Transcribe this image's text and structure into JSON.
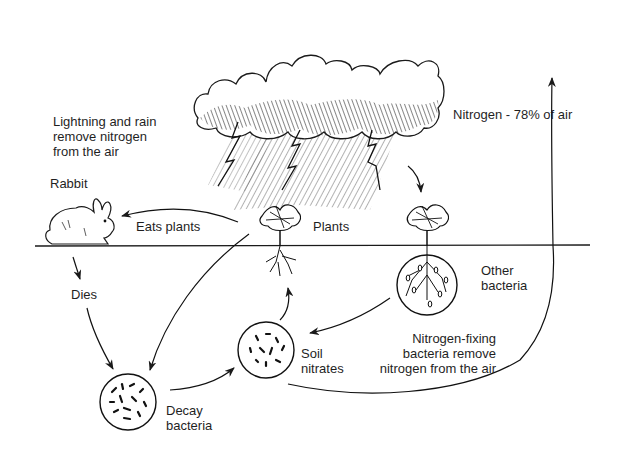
{
  "labels": {
    "lightning": [
      "Lightning and rain",
      "remove nitrogen",
      "from the air"
    ],
    "nitrogen_air": "Nitrogen - 78% of air",
    "rabbit": "Rabbit",
    "eats_plants": "Eats plants",
    "plants": "Plants",
    "dies": "Dies",
    "other_bacteria": [
      "Other",
      "bacteria"
    ],
    "nitrogen_fixing": [
      "Nitrogen-fixing",
      "bacteria remove",
      "nitrogen from the air"
    ],
    "soil_nitrates": [
      "Soil",
      "nitrates"
    ],
    "decay_bacteria": [
      "Decay",
      "bacteria"
    ]
  },
  "nodes": [
    {
      "id": "cloud",
      "name": "Storm cloud with lightning and rain",
      "icon": "storm-cloud-icon"
    },
    {
      "id": "nitrogen-air",
      "name": "Nitrogen - 78% of air"
    },
    {
      "id": "rabbit",
      "name": "Rabbit",
      "icon": "rabbit-icon"
    },
    {
      "id": "plants",
      "name": "Plants",
      "icon": "plant-icon"
    },
    {
      "id": "other-plant",
      "name": "Plant with nitrogen-fixing bacteria",
      "icon": "plant-root-nodules-icon"
    },
    {
      "id": "decay-bacteria",
      "name": "Decay bacteria",
      "icon": "bacteria-circle-icon"
    },
    {
      "id": "soil-nitrates",
      "name": "Soil nitrates",
      "icon": "bacteria-circle-icon"
    }
  ],
  "edges": [
    {
      "from": "plants",
      "to": "rabbit",
      "label": "Eats plants"
    },
    {
      "from": "rabbit",
      "to": "decay-bacteria",
      "label": "Dies"
    },
    {
      "from": "plants",
      "to": "decay-bacteria",
      "label": ""
    },
    {
      "from": "decay-bacteria",
      "to": "soil-nitrates",
      "label": ""
    },
    {
      "from": "soil-nitrates",
      "to": "plants",
      "label": ""
    },
    {
      "from": "other-plant",
      "to": "soil-nitrates",
      "label": ""
    },
    {
      "from": "cloud",
      "to": "other-plant",
      "label": ""
    },
    {
      "from": "soil-nitrates",
      "to": "nitrogen-air",
      "label": ""
    }
  ]
}
